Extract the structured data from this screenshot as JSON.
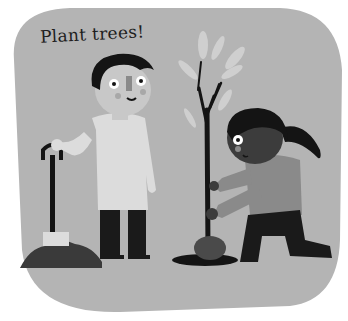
{
  "illustration": {
    "caption": "Plant trees!",
    "colors": {
      "background": "#b4b4b4",
      "boy_shirt": "#dcdcdc",
      "boy_skin": "#c8c8c8",
      "hair": "#141414",
      "trousers": "#1a1a1a",
      "girl_skin": "#3c3c3c",
      "girl_shirt": "#8a8a8a",
      "soil": "#3a3a3a",
      "leaves": "#cfcfcf"
    },
    "characters": [
      {
        "role": "boy",
        "action": "standing holding spade"
      },
      {
        "role": "girl",
        "action": "kneeling planting sapling"
      }
    ],
    "objects": [
      "spade",
      "soil-pile",
      "sapling",
      "planting-hole"
    ]
  }
}
